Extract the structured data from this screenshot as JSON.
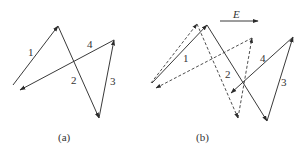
{
  "figure": {
    "panels": [
      {
        "id": "a",
        "caption": "(a)",
        "labels": {
          "l1": "1",
          "l2": "2",
          "l3": "3",
          "l4": "4"
        },
        "solid_path": [
          [
            13,
            85
          ],
          [
            58,
            26
          ],
          [
            99,
            118
          ],
          [
            114,
            40
          ],
          [
            20,
            90
          ]
        ]
      },
      {
        "id": "b",
        "caption": "(b)",
        "labels": {
          "l1": "1",
          "l2": "2",
          "l3": "3",
          "l4": "4"
        },
        "field_label": "E",
        "dashed_path": [
          [
            151,
            83
          ],
          [
            197,
            24
          ],
          [
            238,
            118
          ],
          [
            252,
            38
          ],
          [
            156,
            88
          ]
        ],
        "solid_path": [
          [
            152,
            83
          ],
          [
            207,
            25
          ],
          [
            267,
            121
          ],
          [
            293,
            37
          ],
          [
            231,
            93
          ]
        ]
      }
    ],
    "colors": {
      "stroke": "#3a3a3a",
      "background": "#ffffff"
    }
  }
}
